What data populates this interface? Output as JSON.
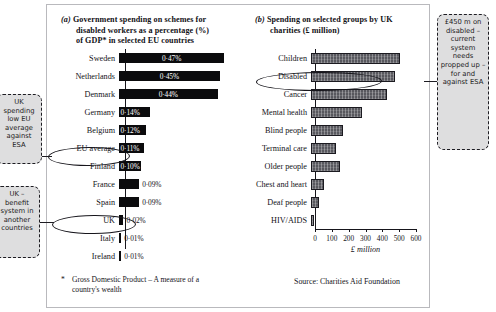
{
  "chart_data": [
    {
      "type": "bar",
      "orientation": "horizontal",
      "panel_tag": "(a)",
      "title": "Government spending on schemes for disabled workers as a percentage (%) of GDP* in selected EU countries",
      "xlabel": "",
      "ylabel": "",
      "categories": [
        "Sweden",
        "Netherlands",
        "Denmark",
        "Germany",
        "Belgium",
        "EU average",
        "Finland",
        "France",
        "Spain",
        "UK",
        "Italy",
        "Ireland"
      ],
      "values": [
        0.47,
        0.45,
        0.44,
        0.14,
        0.12,
        0.11,
        0.1,
        0.09,
        0.09,
        0.02,
        0.01,
        0.01
      ],
      "value_labels": [
        "0·47%",
        "0·45%",
        "0·44%",
        "0·14%",
        "0·12%",
        "0·11%",
        "0·10%",
        "0·09%",
        "0·09%",
        "0·02%",
        "0·01%",
        "0·01%"
      ],
      "label_inside": [
        true,
        true,
        true,
        true,
        true,
        true,
        true,
        false,
        false,
        false,
        false,
        false
      ],
      "xlim": [
        0,
        0.5
      ],
      "grid": false,
      "bar_color": "#0b0b0d",
      "highlighted": [
        "EU average",
        "UK"
      ],
      "footnote": {
        "marker": "*",
        "text": "Gross Domestic Product – A measure of a country's wealth"
      }
    },
    {
      "type": "bar",
      "orientation": "horizontal",
      "panel_tag": "(b)",
      "title": "Spending on selected groups by UK charities (£ million)",
      "xlabel": "£ million",
      "ylabel": "",
      "categories": [
        "Children",
        "Disabled",
        "Cancer",
        "Mental health",
        "Blind people",
        "Terminal care",
        "Older people",
        "Chest and heart",
        "Deaf people",
        "HIV/AIDS"
      ],
      "values": [
        530,
        500,
        450,
        300,
        190,
        150,
        175,
        80,
        50,
        15
      ],
      "xlim": [
        0,
        600
      ],
      "xticks": [
        0,
        100,
        200,
        300,
        400,
        500,
        600
      ],
      "xtick_labels": [
        "0",
        "100",
        "200",
        "300",
        "400",
        "500",
        "600"
      ],
      "grid": false,
      "bar_color": "#58585e",
      "highlighted": [
        "Disabled"
      ],
      "source": "Source:  Charities Aid Foundation"
    }
  ],
  "titles": {
    "a": {
      "tag": "(a)",
      "line1": "Government spending on schemes for",
      "line2": "disabled workers as a percentage (%)",
      "line3": "of GDP* in selected EU countries"
    },
    "b": {
      "tag": "(b)",
      "line1": "Spending on selected groups by UK",
      "line2": "charities (£ million)"
    }
  },
  "footnote": {
    "marker": "*",
    "line1": "Gross Domestic Product – A measure of a",
    "line2": "country's wealth"
  },
  "source_text": "Source:  Charities Aid Foundation",
  "notes": {
    "left_top": "UK spending low EU average against ESA",
    "left_bottom": "UK – benefit system in another countries",
    "right": "£450 m on disabled – current system needs propped up – for and against ESA"
  },
  "colors": {
    "bar_left": "#0b0b0d",
    "bar_right": "#58585e",
    "note_bg": "#dededf",
    "ink": "#16151b"
  }
}
